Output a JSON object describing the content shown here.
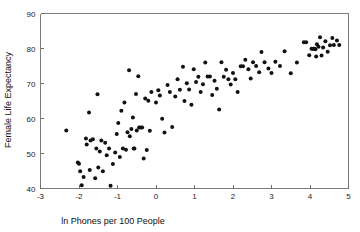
{
  "chart_data": {
    "type": "scatter",
    "title": "",
    "xlabel": "ln Phones per 100 People",
    "ylabel": "Female Life Expectancy",
    "xlim": [
      -3,
      5
    ],
    "ylim": [
      40,
      90
    ],
    "xticks": [
      -3,
      -2,
      -1,
      0,
      1,
      2,
      3,
      4,
      5
    ],
    "xticklabels": [
      "-3",
      "-2",
      "-1",
      "0",
      "1",
      "2",
      "3",
      "4",
      "5"
    ],
    "yticks": [
      40,
      50,
      60,
      70,
      80,
      90
    ],
    "yticklabels": [
      "40",
      "50",
      "60",
      "70",
      "80",
      "90"
    ],
    "grid": false,
    "legend": null,
    "marker": "filled-circle",
    "marker_color": "#111111",
    "marker_size": 2.0,
    "n_points": 105,
    "points": [
      [
        -2.33,
        56.6
      ],
      [
        -2.03,
        47.4
      ],
      [
        -2.0,
        47.1
      ],
      [
        -1.97,
        44.9
      ],
      [
        -1.93,
        40.9
      ],
      [
        -1.88,
        43.3
      ],
      [
        -1.82,
        54.3
      ],
      [
        -1.8,
        52.6
      ],
      [
        -1.74,
        61.7
      ],
      [
        -1.72,
        45.3
      ],
      [
        -1.7,
        53.7
      ],
      [
        -1.64,
        54.1
      ],
      [
        -1.58,
        42.9
      ],
      [
        -1.55,
        51.4
      ],
      [
        -1.52,
        66.9
      ],
      [
        -1.5,
        46.0
      ],
      [
        -1.46,
        50.6
      ],
      [
        -1.42,
        53.7
      ],
      [
        -1.38,
        44.9
      ],
      [
        -1.32,
        53.1
      ],
      [
        -1.28,
        49.5
      ],
      [
        -1.22,
        51.4
      ],
      [
        -1.18,
        40.8
      ],
      [
        -1.12,
        47.0
      ],
      [
        -1.06,
        50.3
      ],
      [
        -1.02,
        55.6
      ],
      [
        -0.98,
        58.7
      ],
      [
        -0.94,
        49.0
      ],
      [
        -0.9,
        62.2
      ],
      [
        -0.86,
        51.4
      ],
      [
        -0.82,
        64.6
      ],
      [
        -0.78,
        51.1
      ],
      [
        -0.74,
        56.1
      ],
      [
        -0.7,
        73.8
      ],
      [
        -0.68,
        54.9
      ],
      [
        -0.64,
        57.0
      ],
      [
        -0.6,
        60.3
      ],
      [
        -0.58,
        51.4
      ],
      [
        -0.56,
        51.4
      ],
      [
        -0.52,
        67.0
      ],
      [
        -0.5,
        56.6
      ],
      [
        -0.46,
        72.1
      ],
      [
        -0.44,
        57.4
      ],
      [
        -0.4,
        57.4
      ],
      [
        -0.36,
        57.4
      ],
      [
        -0.32,
        48.6
      ],
      [
        -0.28,
        65.7
      ],
      [
        -0.24,
        51.0
      ],
      [
        -0.2,
        65.1
      ],
      [
        -0.16,
        56.5
      ],
      [
        -0.12,
        67.6
      ],
      [
        0.0,
        64.6
      ],
      [
        0.06,
        68.1
      ],
      [
        0.1,
        66.6
      ],
      [
        0.16,
        59.9
      ],
      [
        0.22,
        56.0
      ],
      [
        0.3,
        69.6
      ],
      [
        0.36,
        67.6
      ],
      [
        0.42,
        57.6
      ],
      [
        0.5,
        66.3
      ],
      [
        0.56,
        71.2
      ],
      [
        0.62,
        68.2
      ],
      [
        0.7,
        74.8
      ],
      [
        0.74,
        65.0
      ],
      [
        0.8,
        70.1
      ],
      [
        0.86,
        68.3
      ],
      [
        0.92,
        63.9
      ],
      [
        0.98,
        74.1
      ],
      [
        1.04,
        70.4
      ],
      [
        1.1,
        71.9
      ],
      [
        1.16,
        67.6
      ],
      [
        1.22,
        69.8
      ],
      [
        1.28,
        76.0
      ],
      [
        1.34,
        72.0
      ],
      [
        1.4,
        72.0
      ],
      [
        1.46,
        66.7
      ],
      [
        1.52,
        70.8
      ],
      [
        1.58,
        68.5
      ],
      [
        1.64,
        62.6
      ],
      [
        1.7,
        76.1
      ],
      [
        1.76,
        71.9
      ],
      [
        1.82,
        73.9
      ],
      [
        1.88,
        71.2
      ],
      [
        1.94,
        69.7
      ],
      [
        2.0,
        73.0
      ],
      [
        2.06,
        71.2
      ],
      [
        2.12,
        67.6
      ],
      [
        2.2,
        74.9
      ],
      [
        2.26,
        74.9
      ],
      [
        2.32,
        76.8
      ],
      [
        2.4,
        74.1
      ],
      [
        2.46,
        71.4
      ],
      [
        2.52,
        76.1
      ],
      [
        2.6,
        75.0
      ],
      [
        2.68,
        73.2
      ],
      [
        2.74,
        79.0
      ],
      [
        2.82,
        76.1
      ],
      [
        2.92,
        74.3
      ],
      [
        3.0,
        73.0
      ],
      [
        3.1,
        76.2
      ],
      [
        3.22,
        75.0
      ],
      [
        3.34,
        79.2
      ],
      [
        3.5,
        72.9
      ],
      [
        3.66,
        76.0
      ],
      [
        3.84,
        81.8
      ],
      [
        3.9,
        81.8
      ],
      [
        3.98,
        78.1
      ],
      [
        4.04,
        79.9
      ],
      [
        4.08,
        79.9
      ],
      [
        4.1,
        79.9
      ],
      [
        4.12,
        79.9
      ],
      [
        4.14,
        79.8
      ],
      [
        4.16,
        77.7
      ],
      [
        4.18,
        81.2
      ],
      [
        4.22,
        80.5
      ],
      [
        4.26,
        83.2
      ],
      [
        4.3,
        78.0
      ],
      [
        4.34,
        80.3
      ],
      [
        4.4,
        82.1
      ],
      [
        4.46,
        79.1
      ],
      [
        4.52,
        80.9
      ],
      [
        4.58,
        83.0
      ],
      [
        4.62,
        81.0
      ],
      [
        4.7,
        82.3
      ],
      [
        4.76,
        81.0
      ]
    ]
  },
  "figure": {
    "background_color": "#ffffff",
    "axis_color": "#7d7d7d",
    "text_color": "#111111"
  }
}
